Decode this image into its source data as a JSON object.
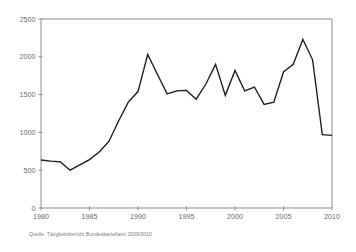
{
  "chart_data": {
    "type": "line",
    "title": "",
    "subtitle": "",
    "xlabel": "",
    "ylabel": "",
    "xlim": [
      1980,
      2010
    ],
    "ylim": [
      0,
      2500
    ],
    "grid": false,
    "legend_position": "none",
    "x_ticks": [
      1980,
      1985,
      1990,
      1995,
      2000,
      2005,
      2010
    ],
    "x_tick_labels": [
      "1980",
      "1985",
      "1990",
      "1995",
      "2000",
      "2005",
      "2010"
    ],
    "y_ticks": [
      0,
      500,
      1000,
      1500,
      2000,
      2500
    ],
    "y_tick_labels": [
      "0",
      "500",
      "1000",
      "1500",
      "2000",
      "2500"
    ],
    "x": [
      1980,
      1981,
      1982,
      1983,
      1984,
      1985,
      1986,
      1987,
      1988,
      1989,
      1990,
      1991,
      1992,
      1993,
      1994,
      1995,
      1996,
      1997,
      1998,
      1999,
      2000,
      2001,
      2002,
      2003,
      2004,
      2005,
      2006,
      2007,
      2008,
      2009,
      2010
    ],
    "series": [
      {
        "name": "Anzahl",
        "color": "#1a1a1a",
        "values": [
          635,
          620,
          610,
          500,
          570,
          640,
          740,
          880,
          1150,
          1400,
          1540,
          2030,
          1770,
          1510,
          1550,
          1555,
          1440,
          1640,
          1900,
          1490,
          1820,
          1550,
          1600,
          1370,
          1400,
          1800,
          1900,
          2230,
          1960,
          970,
          960
        ]
      }
    ],
    "annotations": [],
    "source_note": "Quelle: Tätigkeitsbericht Bundeskartellamt 2009/2010"
  },
  "style": {
    "axis_color": "#8d8d8d",
    "tick_label_color": "#6a6a6a",
    "line_color": "#1a1a1a",
    "background_color": "#ffffff",
    "source_note_color": "#7b7b7b"
  },
  "geometry": {
    "plot_left": 41,
    "plot_right": 332,
    "plot_top": 19,
    "plot_bottom": 208
  }
}
